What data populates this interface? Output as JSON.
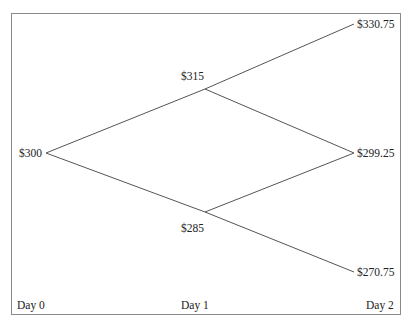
{
  "diagram": {
    "type": "binomial-tree",
    "nodes": [
      {
        "id": "d0",
        "label": "$300",
        "day": 0
      },
      {
        "id": "d1u",
        "label": "$315",
        "day": 1
      },
      {
        "id": "d1d",
        "label": "$285",
        "day": 1
      },
      {
        "id": "d2uu",
        "label": "$330.75",
        "day": 2
      },
      {
        "id": "d2ud",
        "label": "$299.25",
        "day": 2
      },
      {
        "id": "d2dd",
        "label": "$270.75",
        "day": 2
      }
    ],
    "edges": [
      [
        "$300",
        "$315"
      ],
      [
        "$300",
        "$285"
      ],
      [
        "$315",
        "$330.75"
      ],
      [
        "$315",
        "$299.25"
      ],
      [
        "$285",
        "$299.25"
      ],
      [
        "$285",
        "$270.75"
      ]
    ],
    "axis_labels": [
      "Day 0",
      "Day 1",
      "Day 2"
    ],
    "line_color": "#555555",
    "frame_color": "#8a8a8a"
  }
}
